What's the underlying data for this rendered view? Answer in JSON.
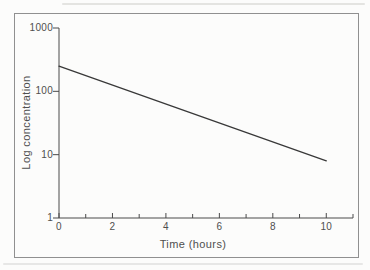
{
  "figure": {
    "background": "#fcfcfb",
    "border_color": "#909090",
    "axis_color": "#4a4a4a",
    "text_color": "#4f4f4f"
  },
  "chart_data": {
    "type": "line",
    "title": "",
    "xlabel": "Time (hours)",
    "ylabel": "Log concentration",
    "x_scale": "linear",
    "y_scale": "log",
    "xlim": [
      0,
      11
    ],
    "ylim": [
      1,
      1000
    ],
    "x_ticks_major": [
      0,
      2,
      4,
      6,
      8,
      10
    ],
    "x_tick_labels": [
      "0",
      "2",
      "4",
      "6",
      "8",
      "10"
    ],
    "x_ticks_minor": [
      1,
      3,
      5,
      7,
      9,
      11
    ],
    "y_ticks": [
      1000,
      100,
      10,
      1
    ],
    "y_tick_labels": [
      "1000",
      "100",
      "10",
      "1"
    ],
    "grid": false,
    "legend": false,
    "series": [
      {
        "name": "concentration",
        "color": "#383838",
        "points": [
          [
            0,
            250
          ],
          [
            10,
            8
          ]
        ]
      }
    ]
  }
}
